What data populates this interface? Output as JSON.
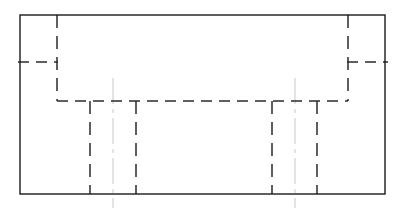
{
  "document": {
    "title": "Engineering Drawing - Orthographic View",
    "view_type": "front elevation",
    "width_px": 404,
    "height_px": 215,
    "background_color": "#ffffff"
  },
  "line_styles": {
    "visible_edge": {
      "name": "continuous thick",
      "color": "#1a1a1a",
      "width": 1.4,
      "dash": "none"
    },
    "hidden_edge": {
      "name": "dashed medium",
      "color": "#2b2b2b",
      "width": 1.5,
      "dash": "11 7"
    },
    "hidden_edge_vertical": {
      "name": "dashed medium vertical",
      "color": "#2b2b2b",
      "width": 1.5,
      "dash": "13 8"
    },
    "center_line": {
      "name": "chain thin",
      "color": "#c8c8c8",
      "width": 1.0,
      "dash": "26 5 4 5"
    }
  },
  "geometry": {
    "outline": {
      "label": "outer profile rectangle",
      "x1": 20,
      "y1": 15,
      "x2": 385,
      "y2": 194,
      "width": 365,
      "height": 179
    },
    "hidden_recess": {
      "label": "inner recess outline (hidden)",
      "left_x": 57,
      "right_x": 348,
      "top_y": 15,
      "bottom_y": 101
    },
    "hidden_vertical_lines": [
      {
        "name": "recess-left-wall",
        "x": 57,
        "y1": 15,
        "y2": 101
      },
      {
        "name": "recess-right-wall",
        "x": 348,
        "y1": 15,
        "y2": 101
      },
      {
        "name": "bore-1-left-wall",
        "x": 90,
        "y1": 101,
        "y2": 194
      },
      {
        "name": "bore-1-right-wall",
        "x": 136,
        "y1": 101,
        "y2": 194
      },
      {
        "name": "bore-2-left-wall",
        "x": 272,
        "y1": 101,
        "y2": 194
      },
      {
        "name": "bore-2-right-wall",
        "x": 317,
        "y1": 101,
        "y2": 194
      }
    ],
    "hidden_horizontal_lines": [
      {
        "name": "recess-floor",
        "y": 101,
        "x1": 57,
        "x2": 348
      },
      {
        "name": "left-step-tick",
        "y": 62,
        "x1": 18,
        "x2": 58
      },
      {
        "name": "right-step-tick",
        "y": 62,
        "x1": 347,
        "x2": 388
      }
    ],
    "center_lines": [
      {
        "name": "bore-1-axis",
        "x": 113,
        "y1": 78,
        "y2": 208
      },
      {
        "name": "bore-2-axis",
        "x": 295,
        "y1": 78,
        "y2": 208
      }
    ]
  }
}
